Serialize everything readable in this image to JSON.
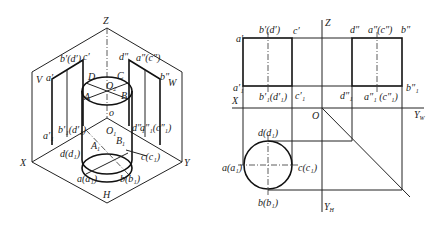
{
  "figures": {
    "isometric": {
      "axis_labels": {
        "z": "Z",
        "x": "X",
        "y": "Y",
        "h": "H",
        "v": "V",
        "w": "W",
        "o": "o"
      },
      "points_top": {
        "A": "A",
        "B": "B",
        "C": "C",
        "D": "D",
        "O2": "O",
        "O2_sub": "2"
      },
      "points_bottom": {
        "A1": "A",
        "A1_sub": "1",
        "B1": "B",
        "B1_sub": "1",
        "O1": "O",
        "O1_sub": "1"
      },
      "v_projection": {
        "a_top": "a′",
        "bd_top": "b′(d′)",
        "c_top": "c′",
        "a_bot": "a′₁",
        "bd_bot": "b′₁(d′₁)"
      },
      "w_projection": {
        "d_top": "d″",
        "ac_top": "a″(c″)",
        "b_top": "b″",
        "d_bot": "d″₁",
        "ac_bot": "a″₁(c″₁)",
        "b_bot": "b″₁"
      },
      "h_projection": {
        "d": "d(d₁)",
        "c": "c(c₁)",
        "a": "a(a₁)",
        "b": "b(b₁)"
      }
    },
    "orthographic": {
      "axis_labels": {
        "z": "Z",
        "x": "X",
        "o": "O",
        "yw": "Y",
        "yw_sub": "W",
        "yh": "Y",
        "yh_sub": "H"
      },
      "front_view": {
        "a": "a′",
        "bd": "b′(d′)",
        "c": "c′",
        "a1": "a′₁",
        "bd1": "b′₁(d′₁)",
        "c1": "c′₁"
      },
      "side_view": {
        "d": "d″",
        "ac": "a″(c″)",
        "b": "b″",
        "d1": "d″₁",
        "ac1": "a″₁ (c″₁)",
        "b1": "b″₁"
      },
      "top_view": {
        "d": "d(d₁)",
        "a": "a(a₁)",
        "c": "c(c₁)",
        "b": "b(b₁)"
      }
    }
  }
}
